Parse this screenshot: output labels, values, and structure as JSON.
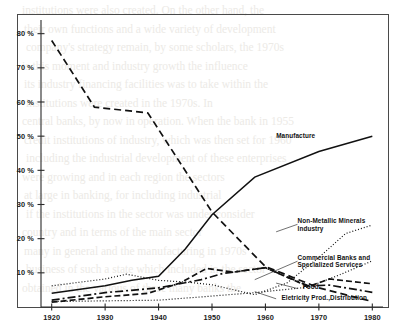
{
  "figure": {
    "name": "percentage-share-line-chart",
    "frame_visible": true
  },
  "background_text": {
    "note": "faint bleed-through text from reverse side of scanned page",
    "lines": [
      "institutions were also created. On the other hand, the",
      "their own functions and a wide variety of development",
      "company's strategy remain, by some scholars, the 1970s",
      "is this moment and industry growth the influence",
      "its industry financing facilities was to take within the",
      "institutions were created in the 1970s. In",
      "central banks, by now in operation. When the bank in 1955",
      "credit institutions of industry, which was then set for 1960",
      "including the industrial development of these enterprises",
      "were growing and in each region the sectors",
      "at large in banking, for including industrial",
      "if the institutions in the sector was under consider",
      "country and in terms of the main sector",
      "many in general and the manufacturing in 1970s",
      "business of such a state which included in the sector",
      "obtained in the various of these many banks the"
    ]
  },
  "chart_data": {
    "type": "line",
    "title": "",
    "xlabel": "",
    "ylabel": "",
    "xlim": [
      1918,
      1982
    ],
    "ylim": [
      0,
      84
    ],
    "grid": false,
    "legend": "inline-right-labels",
    "x_ticks": [
      1920,
      1930,
      1940,
      1950,
      1960,
      1970,
      1980
    ],
    "x_tick_labels": [
      "1920",
      "1930",
      "1940",
      "1950",
      "1960",
      "1970",
      "1980"
    ],
    "y_ticks": [
      10,
      20,
      30,
      40,
      50,
      60,
      70,
      80
    ],
    "y_tick_labels": [
      "10 %",
      "20 %",
      "30 %",
      "40 %",
      "50 %",
      "60 %",
      "70 %",
      "80 %"
    ],
    "series": [
      {
        "name": "Agriculture (unlabeled declining dashed)",
        "label": "",
        "style": "dashed",
        "dash": "7,4",
        "width": 1.7,
        "label_x": null,
        "label_y": null,
        "points": [
          [
            1920,
            78.0
          ],
          [
            1928,
            58.5
          ],
          [
            1938,
            56.8
          ],
          [
            1950,
            27.8
          ],
          [
            1960,
            11.8
          ],
          [
            1963,
            10.0
          ],
          [
            1970,
            5.6
          ],
          [
            1980,
            1.6
          ]
        ]
      },
      {
        "name": "Manufacture",
        "label": "Manufacture",
        "style": "solid",
        "dash": "none",
        "width": 1.5,
        "label_x": 1962,
        "label_y": 49.5,
        "points": [
          [
            1920,
            4.0
          ],
          [
            1930,
            6.2
          ],
          [
            1935,
            7.8
          ],
          [
            1940,
            9.0
          ],
          [
            1945,
            17.0
          ],
          [
            1950,
            27.0
          ],
          [
            1958,
            38.0
          ],
          [
            1970,
            45.5
          ],
          [
            1980,
            50.0
          ]
        ]
      },
      {
        "name": "Non-Metallic Minerals Industry",
        "label": "Non-Metallic Minerals Industry",
        "label_lines": [
          "Non-Metallic Minerals",
          "Industry"
        ],
        "style": "dotted",
        "dash": "1,2",
        "width": 1.2,
        "label_x": 1966,
        "label_y": 24.5,
        "points": [
          [
            1920,
            6.2
          ],
          [
            1930,
            8.2
          ],
          [
            1934,
            9.6
          ],
          [
            1940,
            7.8
          ],
          [
            1946,
            7.2
          ],
          [
            1950,
            6.5
          ],
          [
            1958,
            3.6
          ],
          [
            1964,
            7.0
          ],
          [
            1970,
            14.5
          ],
          [
            1975,
            21.5
          ],
          [
            1980,
            24.0
          ]
        ]
      },
      {
        "name": "Commercial Banks and Specialized Services",
        "label": "Commercial Banks and Specialized Services",
        "label_lines": [
          "Commercial Banks and",
          "Specialized Services"
        ],
        "style": "dotted",
        "dash": "1,2",
        "width": 1.2,
        "label_x": 1966,
        "label_y": 13.8,
        "points": [
          [
            1920,
            1.6
          ],
          [
            1930,
            1.8
          ],
          [
            1940,
            2.0
          ],
          [
            1950,
            3.2
          ],
          [
            1958,
            4.2
          ],
          [
            1968,
            5.8
          ],
          [
            1974,
            9.5
          ],
          [
            1980,
            13.5
          ]
        ]
      },
      {
        "name": "Food",
        "label": "Food",
        "style": "dash-dot",
        "dash": "8,3,2,3",
        "width": 1.7,
        "label_x": 1967,
        "label_y": 5.2,
        "points": [
          [
            1920,
            2.0
          ],
          [
            1930,
            4.2
          ],
          [
            1940,
            5.6
          ],
          [
            1948,
            8.0
          ],
          [
            1952,
            9.8
          ],
          [
            1960,
            11.5
          ],
          [
            1968,
            6.2
          ],
          [
            1972,
            6.4
          ],
          [
            1980,
            4.3
          ]
        ]
      },
      {
        "name": "Eletricity Prod.,Distribution",
        "label": "Eletricity Prod.,Distribution",
        "style": "dashed-long",
        "dash": "6,3",
        "width": 1.7,
        "label_x": 1963,
        "label_y": 2.1,
        "points": [
          [
            1920,
            1.4
          ],
          [
            1930,
            3.0
          ],
          [
            1938,
            4.0
          ],
          [
            1944,
            7.0
          ],
          [
            1949,
            11.3
          ],
          [
            1954,
            10.2
          ],
          [
            1960,
            11.5
          ],
          [
            1968,
            6.0
          ],
          [
            1972,
            8.2
          ],
          [
            1980,
            6.8
          ]
        ]
      }
    ],
    "annotations": [
      {
        "name": "leader-non-metallic",
        "from": [
          1962,
          22.0
        ],
        "to": [
          1966,
          24.2
        ]
      },
      {
        "name": "leader-commercial-banks",
        "from": [
          1958,
          8.0
        ],
        "to": [
          1966,
          13.4
        ]
      },
      {
        "name": "leader-food",
        "from": [
          1962,
          7.0
        ],
        "to": [
          1966,
          5.4
        ]
      },
      {
        "name": "leader-electricity",
        "from": [
          1958,
          4.5
        ],
        "to": [
          1962,
          2.4
        ]
      }
    ]
  }
}
